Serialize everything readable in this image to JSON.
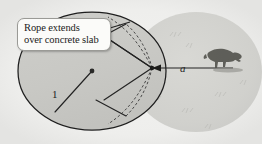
{
  "figure": {
    "type": "geometry-diagram",
    "callout": {
      "line1": "Rope extends",
      "line2": "over concrete slab"
    },
    "labels": {
      "radius": "1",
      "rope_length": "a"
    },
    "colors": {
      "background": "#efefed",
      "slab_fill": "#c9c9c5",
      "slab_stroke": "#1e1e1e",
      "grass_fill": "#d2d2ce",
      "callout_fill": "#fbfbf9",
      "callout_stroke": "#9a9a96",
      "line_stroke": "#232323",
      "dash_stroke": "#3a3a3a",
      "animal_fill": "#4a4a46"
    },
    "elements": {
      "slab_label": "concrete slab circle",
      "grass_label": "grazing region",
      "center_dot_label": "slab center",
      "radius_line_label": "slab radius",
      "rope_line_label": "rope at full extension",
      "attach_point_label": "rope attachment point",
      "animal_label": "grazing goat",
      "dashed_arc_label": "rope wrapped over slab",
      "leader_line_label": "callout leader line"
    },
    "geometry": {
      "slab_center": [
        92,
        71
      ],
      "slab_rx": 74,
      "slab_ry": 59,
      "grass_center": [
        196,
        72
      ],
      "grass_rx": 66,
      "grass_ry": 60,
      "attach_point": [
        152,
        68
      ],
      "rope_end": [
        233,
        68
      ]
    }
  }
}
